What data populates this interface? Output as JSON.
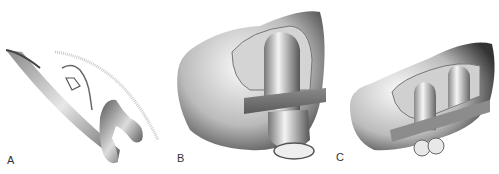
{
  "figure": {
    "panels": [
      {
        "label": "A",
        "description": "Thin curved slice cross-section of rendered 3D bone model"
      },
      {
        "label": "B",
        "description": "Shaded 3D render of bone model, front-oblique view"
      },
      {
        "label": "C",
        "description": "Shaded 3D render of bone model, inferior-oblique view"
      }
    ]
  }
}
